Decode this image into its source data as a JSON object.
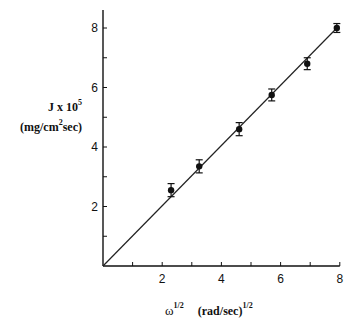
{
  "chart_data": {
    "type": "scatter",
    "title": "",
    "xlabel": "ω^1/2 (rad/sec)^1/2",
    "ylabel": "J x 10^5 (mg/cm^2 sec)",
    "xlim": [
      0,
      8
    ],
    "ylim": [
      0,
      8
    ],
    "x_ticks": [
      2,
      4,
      6,
      8
    ],
    "x_minor_ticks": [
      1,
      3,
      5,
      7
    ],
    "y_ticks": [
      2,
      4,
      6,
      8
    ],
    "y_minor_ticks": [
      1,
      3,
      5,
      7
    ],
    "grid": false,
    "legend": null,
    "series": [
      {
        "name": "measured",
        "marker": "filled-circle",
        "x": [
          2.3,
          3.25,
          4.6,
          5.7,
          6.9,
          7.9
        ],
        "y": [
          2.55,
          3.35,
          4.6,
          5.75,
          6.8,
          8.0
        ],
        "y_error": [
          0.22,
          0.22,
          0.22,
          0.2,
          0.2,
          0.15
        ]
      }
    ],
    "fit_line": {
      "x": [
        0,
        7.9
      ],
      "y": [
        0,
        8.0
      ],
      "style": "solid"
    }
  },
  "labels": {
    "y_title_line1_main": "J x 10",
    "y_title_line1_sup": "5",
    "y_title_line2_a": "(mg/cm",
    "y_title_line2_sup": "2",
    "y_title_line2_b": "sec)",
    "x_title_omega": "ω",
    "x_title_omega_sup": "1/2",
    "x_title_units": "(rad/sec)",
    "x_title_units_sup": "1/2"
  }
}
